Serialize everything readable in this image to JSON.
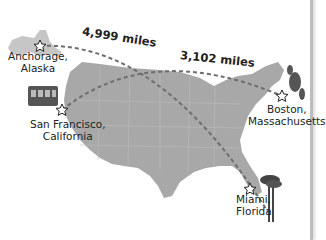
{
  "routes": [
    {
      "from": "Anchorage, Alaska",
      "to": "Miami, Florida",
      "distance_label": "4,999 miles"
    },
    {
      "from": "San Francisco, California",
      "to": "Boston, Massachusetts",
      "distance_label": "3,102 miles"
    }
  ],
  "cities": {
    "anchorage": {
      "line1": "Anchorage,",
      "line2": "Alaska",
      "icon": "bear-icon"
    },
    "san_francisco": {
      "line1": "San Francisco,",
      "line2": "California",
      "icon": "cable-car-icon"
    },
    "boston": {
      "line1": "Boston,",
      "line2": "Massachusetts",
      "icon": "lobster-icon"
    },
    "miami": {
      "line1": "Miami,",
      "line2": "Florida",
      "icon": "palm-tree-icon"
    }
  },
  "colors": {
    "land": "#a9a9a9",
    "alaska": "#c8c8c8",
    "route": "#6e6e6e",
    "background": "#ffffff"
  }
}
